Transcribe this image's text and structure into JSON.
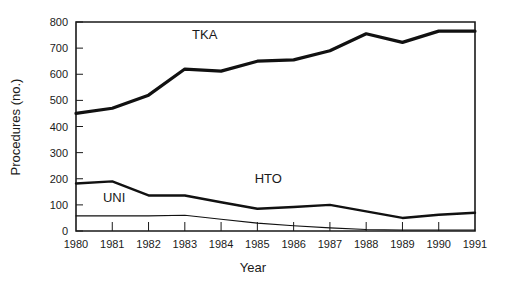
{
  "chart_data": {
    "type": "line",
    "title": "",
    "xlabel": "Year",
    "ylabel": "Procedures (no.)",
    "x": [
      1980,
      1981,
      1982,
      1983,
      1984,
      1985,
      1986,
      1987,
      1988,
      1989,
      1990,
      1991
    ],
    "categories": [
      "1980",
      "1981",
      "1982",
      "1983",
      "1984",
      "1985",
      "1986",
      "1987",
      "1988",
      "1989",
      "1990",
      "1991"
    ],
    "xlim": [
      1980,
      1991
    ],
    "ylim": [
      0,
      800
    ],
    "yticks": [
      0,
      100,
      200,
      300,
      400,
      500,
      600,
      700,
      800
    ],
    "yticklabels": [
      "0",
      "100",
      "200",
      "300",
      "400",
      "500",
      "600",
      "700",
      "800"
    ],
    "grid": false,
    "legend": "inline-annotations",
    "series": [
      {
        "name": "TKA",
        "label": "TKA",
        "values": [
          450,
          470,
          520,
          620,
          612,
          650,
          655,
          690,
          755,
          722,
          765,
          765
        ],
        "stroke_width": 3.2,
        "color": "#111111",
        "label_x": 1983.55,
        "label_y": 735
      },
      {
        "name": "HTO",
        "label": "HTO",
        "values": [
          182,
          190,
          136,
          136,
          110,
          85,
          92,
          100,
          75,
          50,
          62,
          70
        ],
        "stroke_width": 2.4,
        "color": "#111111",
        "label_x": 1985.3,
        "label_y": 182
      },
      {
        "name": "UNI",
        "label": "UNI",
        "values": [
          58,
          58,
          58,
          60,
          45,
          30,
          20,
          12,
          6,
          4,
          4,
          4
        ],
        "stroke_width": 1.1,
        "color": "#111111",
        "label_x": 1981.05,
        "label_y": 112
      }
    ],
    "annotations": [
      {
        "text": "TKA",
        "series": "TKA"
      },
      {
        "text": "HTO",
        "series": "HTO"
      },
      {
        "text": "UNI",
        "series": "UNI"
      }
    ]
  },
  "axes": {
    "y_title": "Procedures (no.)",
    "x_title": "Year"
  }
}
